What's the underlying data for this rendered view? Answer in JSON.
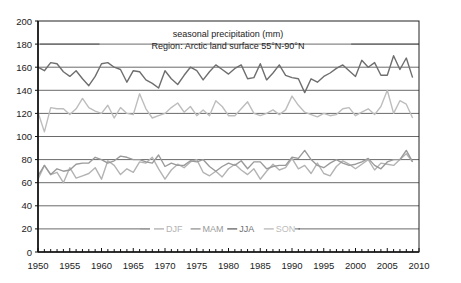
{
  "chart_data": {
    "type": "line",
    "title": "seasonal precipitation (mm)",
    "subtitle": "Region: Arctic land surface 55°N-90°N",
    "xlabel": "",
    "ylabel": "",
    "xlim": [
      1950,
      2010
    ],
    "ylim": [
      0,
      200
    ],
    "x_ticks": [
      1950,
      1955,
      1960,
      1965,
      1970,
      1975,
      1980,
      1985,
      1990,
      1995,
      2000,
      2005,
      2010
    ],
    "y_ticks": [
      0,
      20,
      40,
      60,
      80,
      100,
      120,
      140,
      160,
      180,
      200
    ],
    "grid": "horizontal",
    "legend_position": "bottom-center inside plot (y≈20)",
    "x": [
      1950,
      1951,
      1952,
      1953,
      1954,
      1955,
      1956,
      1957,
      1958,
      1959,
      1960,
      1961,
      1962,
      1963,
      1964,
      1965,
      1966,
      1967,
      1968,
      1969,
      1970,
      1971,
      1972,
      1973,
      1974,
      1975,
      1976,
      1977,
      1978,
      1979,
      1980,
      1981,
      1982,
      1983,
      1984,
      1985,
      1986,
      1987,
      1988,
      1989,
      1990,
      1991,
      1992,
      1993,
      1994,
      1995,
      1996,
      1997,
      1998,
      1999,
      2000,
      2001,
      2002,
      2003,
      2004,
      2005,
      2006,
      2007,
      2008,
      2009
    ],
    "series": [
      {
        "name": "DJF",
        "color": "#b3b3b3",
        "values": [
          63,
          75,
          67,
          69,
          60,
          73,
          64,
          66,
          68,
          73,
          63,
          79,
          75,
          67,
          72,
          69,
          78,
          77,
          82,
          72,
          63,
          71,
          76,
          73,
          78,
          80,
          69,
          66,
          70,
          65,
          72,
          76,
          71,
          67,
          72,
          63,
          70,
          76,
          71,
          73,
          81,
          72,
          75,
          68,
          77,
          68,
          66,
          74,
          79,
          76,
          72,
          76,
          80,
          71,
          77,
          76,
          75,
          80,
          85,
          78
        ]
      },
      {
        "name": "MAM",
        "color": "#9a9a9a",
        "values": [
          66,
          75,
          67,
          72,
          70,
          71,
          76,
          77,
          77,
          82,
          80,
          77,
          79,
          83,
          82,
          80,
          80,
          78,
          77,
          84,
          74,
          77,
          75,
          75,
          79,
          78,
          80,
          74,
          70,
          74,
          77,
          75,
          79,
          72,
          78,
          78,
          72,
          74,
          75,
          75,
          82,
          81,
          88,
          80,
          75,
          73,
          77,
          80,
          77,
          75,
          76,
          78,
          81,
          75,
          72,
          78,
          80,
          80,
          88,
          78
        ]
      },
      {
        "name": "JJA",
        "color": "#6e6e6e",
        "values": [
          160,
          157,
          164,
          163,
          156,
          152,
          157,
          150,
          144,
          152,
          163,
          164,
          160,
          158,
          147,
          157,
          156,
          149,
          146,
          142,
          157,
          150,
          145,
          153,
          160,
          157,
          149,
          156,
          162,
          158,
          154,
          159,
          162,
          150,
          151,
          163,
          149,
          155,
          162,
          153,
          151,
          150,
          138,
          150,
          147,
          152,
          155,
          159,
          162,
          157,
          152,
          166,
          160,
          164,
          153,
          153,
          170,
          158,
          168,
          151
        ]
      },
      {
        "name": "SON",
        "color": "#bdbdbd",
        "values": [
          121,
          104,
          125,
          124,
          124,
          119,
          124,
          133,
          125,
          122,
          120,
          127,
          116,
          125,
          120,
          119,
          137,
          124,
          116,
          118,
          120,
          125,
          129,
          121,
          126,
          118,
          123,
          118,
          131,
          126,
          118,
          118,
          124,
          130,
          120,
          118,
          120,
          123,
          119,
          123,
          135,
          127,
          121,
          119,
          117,
          120,
          118,
          119,
          124,
          125,
          118,
          121,
          124,
          119,
          126,
          140,
          120,
          131,
          128,
          116
        ]
      }
    ],
    "reference_lines": [
      {
        "y": 180,
        "x_from": 1950,
        "x_to": 1960
      },
      {
        "y": 180,
        "x_from": 1999,
        "x_to": 2010
      }
    ]
  },
  "legend": {
    "items": [
      {
        "label": "DJF",
        "color": "#b3b3b3"
      },
      {
        "label": "MAM",
        "color": "#9a9a9a"
      },
      {
        "label": "JJA",
        "color": "#6e6e6e"
      },
      {
        "label": "SON",
        "color": "#bdbdbd"
      }
    ]
  },
  "axes": {
    "x_labels": [
      "1950",
      "1955",
      "1960",
      "1965",
      "1970",
      "1975",
      "1980",
      "1985",
      "1990",
      "1995",
      "2000",
      "2005",
      "2010"
    ],
    "y_labels": [
      "0",
      "20",
      "40",
      "60",
      "80",
      "100",
      "120",
      "140",
      "160",
      "180",
      "200"
    ]
  }
}
